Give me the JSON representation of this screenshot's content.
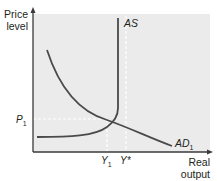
{
  "figure": {
    "type": "AS-AD diagram",
    "colors": {
      "plot_background": "#ebebeb",
      "axis": "#3a3a3a",
      "curve": "#4a4a4a",
      "dashed_guide": "#ffffff",
      "text": "#231f20"
    },
    "y_axis": {
      "label_line1": "Price",
      "label_line2": "level"
    },
    "x_axis": {
      "label_line1": "Real",
      "label_line2": "output"
    },
    "curves": {
      "as": {
        "label": "AS",
        "shape": "flat then vertical at full capacity (Y*)"
      },
      "ad": {
        "label_main": "AD",
        "label_sub": "1",
        "shape": "downward sloping"
      }
    },
    "markers": {
      "p1": {
        "label_main": "P",
        "label_sub": "1"
      },
      "y1": {
        "label_main": "Y",
        "label_sub": "1"
      },
      "ystar": {
        "label": "Y*"
      }
    }
  }
}
